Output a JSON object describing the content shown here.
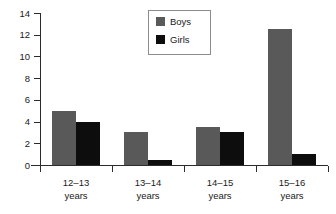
{
  "chart_data": {
    "type": "bar",
    "title": "",
    "subtitle": "",
    "xlabel": "",
    "ylabel": "",
    "categories": [
      "12–13\nyears",
      "13–14\nyears",
      "14–15\nyears",
      "15–16\nyears"
    ],
    "series": [
      {
        "name": "Boys",
        "color": "#595959",
        "values": [
          5,
          3,
          3.5,
          12.5
        ]
      },
      {
        "name": "Girls",
        "color": "#0d0d0d",
        "values": [
          4,
          0.5,
          3,
          1
        ]
      }
    ],
    "ylim": [
      0,
      14
    ],
    "ytick_values": [
      0,
      2,
      4,
      6,
      8,
      10,
      12,
      14
    ],
    "ytick_labels": [
      "0",
      "2",
      "4",
      "6",
      "8",
      "10",
      "12",
      "14"
    ],
    "grid": false,
    "legend_position": "top-center",
    "legend_entries": [
      "Boys",
      "Girls"
    ],
    "annotations": []
  },
  "legend": {
    "items": [
      {
        "label": "Boys",
        "swatch": "boys-swatch"
      },
      {
        "label": "Girls",
        "swatch": "girls-swatch"
      }
    ]
  },
  "axes": {
    "y_labels": [
      "14",
      "12",
      "10",
      "8",
      "6",
      "4",
      "2",
      "0"
    ],
    "x_labels": [
      "12–13\nyears",
      "13–14\nyears",
      "14–15\nyears",
      "15–16\nyears"
    ]
  }
}
